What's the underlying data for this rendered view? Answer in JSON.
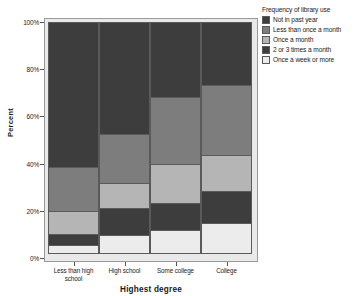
{
  "chart_data": {
    "type": "bar",
    "subtype": "stacked-percent",
    "title": "",
    "xlabel": "Highest degree",
    "ylabel": "Percent",
    "categories": [
      "Less than high school",
      "High school",
      "Some college",
      "College"
    ],
    "ylim": [
      0,
      100
    ],
    "ytick_labels": [
      "0%",
      "20%",
      "40%",
      "60%",
      "80%",
      "100%"
    ],
    "ytick_values": [
      0,
      20,
      40,
      60,
      80,
      100
    ],
    "grid": false,
    "legend_position": "right",
    "legend_title": "Frequency of library use",
    "stack_order_bottom_to_top": [
      "Once a week or more",
      "2 or 3 times a month",
      "Once a month",
      "Less than once a month",
      "Not in past year"
    ],
    "series": [
      {
        "name": "Not in past year",
        "color": "#3d3d3d",
        "values": [
          62,
          48,
          32,
          27
        ]
      },
      {
        "name": "Less than once a month",
        "color": "#7d7d7d",
        "values": [
          19,
          21,
          29,
          30
        ]
      },
      {
        "name": "Once a month",
        "color": "#b5b5b5",
        "values": [
          10,
          11,
          17,
          16
        ]
      },
      {
        "name": "2 or 3 times a month",
        "color": "#3d3d3d",
        "values": [
          5,
          12,
          12,
          14
        ]
      },
      {
        "name": "Once a week or more",
        "color": "#ececec",
        "values": [
          4,
          8,
          10,
          13
        ]
      }
    ]
  },
  "legend": {
    "title": "Frequency of library use",
    "items": [
      {
        "label": "Not in past year",
        "color": "#3d3d3d"
      },
      {
        "label": "Less than once a month",
        "color": "#7d7d7d"
      },
      {
        "label": "Once a month",
        "color": "#b5b5b5"
      },
      {
        "label": "2 or 3 times a month",
        "color": "#3d3d3d"
      },
      {
        "label": "Once a week or more",
        "color": "#ececec"
      }
    ]
  },
  "axes": {
    "y_label": "Percent",
    "x_label": "Highest degree",
    "y_ticks": [
      "100%",
      "80%",
      "60%",
      "40%",
      "20%",
      "0%"
    ],
    "x_ticks": [
      "Less than high school",
      "High school",
      "Some college",
      "College"
    ]
  },
  "colors": {
    "plot_background": "#e9e9e9",
    "frame": "#9a9a9a",
    "segment_border": "#5a5a5a",
    "page_background": "#ffffff"
  }
}
